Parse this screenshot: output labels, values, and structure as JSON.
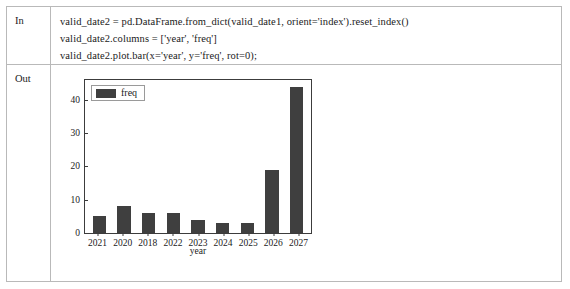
{
  "notebook": {
    "in_label": "In",
    "out_label": "Out",
    "code_lines": [
      "valid_date2 = pd.DataFrame.from_dict(valid_date1, orient='index').reset_index()",
      "valid_date2.columns = ['year', 'freq']",
      "valid_date2.plot.bar(x='year', y='freq', rot=0);"
    ]
  },
  "chart_data": {
    "type": "bar",
    "title": "",
    "categories": [
      "2021",
      "2020",
      "2018",
      "2022",
      "2023",
      "2024",
      "2025",
      "2026",
      "2027"
    ],
    "values": [
      5,
      8,
      6,
      6,
      4,
      3,
      3,
      19,
      44
    ],
    "series": [
      {
        "name": "freq",
        "values": [
          5,
          8,
          6,
          6,
          4,
          3,
          3,
          19,
          44
        ],
        "color": "#3f3f3f"
      }
    ],
    "xlabel": "year",
    "ylabel": "",
    "ylim": [
      0,
      46
    ],
    "yticks": [
      0,
      10,
      20,
      30,
      40
    ],
    "ytick_labels": [
      "0",
      "10",
      "20",
      "30",
      "40"
    ],
    "grid": false,
    "legend": {
      "position": "upper-left",
      "entries": [
        "freq"
      ]
    }
  }
}
